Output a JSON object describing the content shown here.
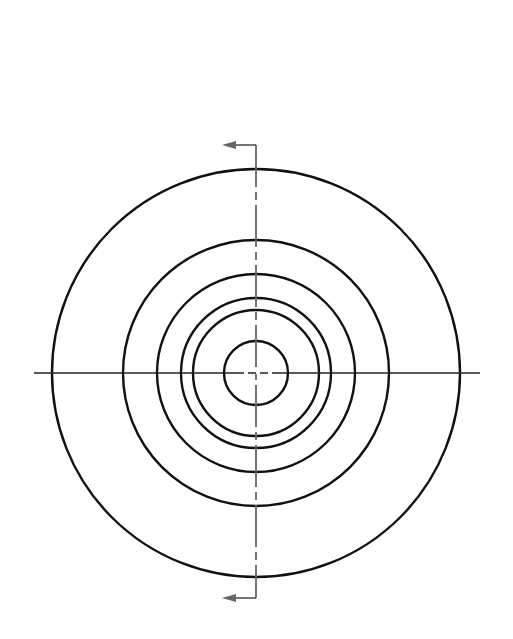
{
  "diagram": {
    "type": "concentric-circles-section-view",
    "center": {
      "x": 256,
      "y": 373
    },
    "circles": [
      {
        "name": "outer-circle",
        "r": 204
      },
      {
        "name": "ring-2",
        "r": 133
      },
      {
        "name": "ring-3",
        "r": 99
      },
      {
        "name": "ring-4",
        "r": 75
      },
      {
        "name": "ring-5",
        "r": 63
      },
      {
        "name": "inner-circle",
        "r": 32
      }
    ],
    "horizontal_centerline": {
      "x1": 34,
      "x2": 480
    },
    "section_line": {
      "y_top": 145,
      "y_bottom": 598,
      "arrow_x": 222
    },
    "colors": {
      "circle": "#111111",
      "centerline": "#222222",
      "section": "#666666"
    }
  }
}
